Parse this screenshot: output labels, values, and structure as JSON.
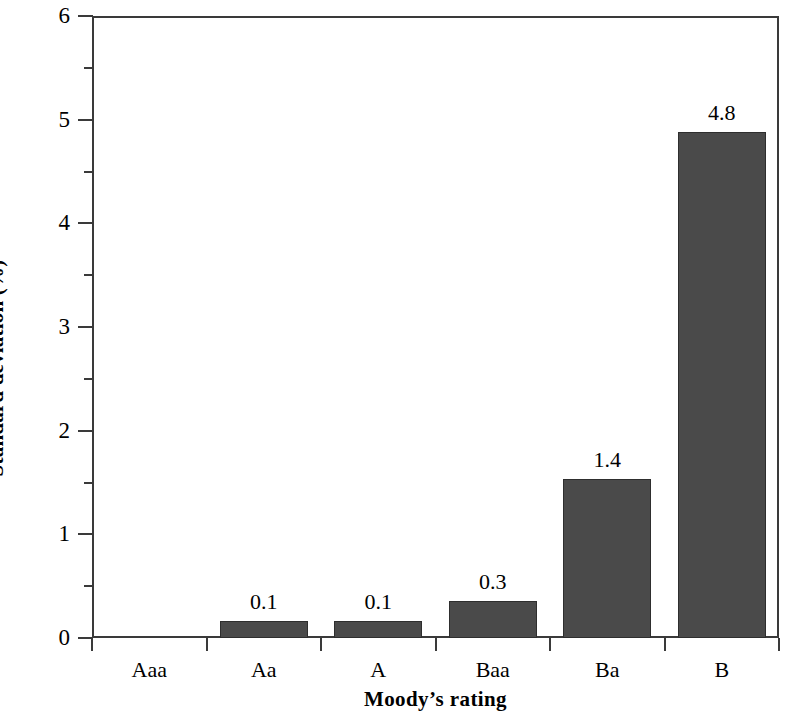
{
  "chart_data": {
    "type": "bar",
    "title": "",
    "xlabel": "Moody’s rating",
    "ylabel": "Standard deviation (%)",
    "categories": [
      "Aaa",
      "Aa",
      "A",
      "Baa",
      "Ba",
      "B"
    ],
    "values": [
      0.0,
      0.1,
      0.1,
      0.3,
      1.4,
      4.8
    ],
    "bar_pixel_values": [
      0.0,
      0.16,
      0.16,
      0.36,
      1.53,
      4.88
    ],
    "data_labels": [
      "",
      "0.1",
      "0.1",
      "0.3",
      "1.4",
      "4.8"
    ],
    "ylim": [
      0,
      6
    ],
    "y_major_ticks": [
      0,
      1,
      2,
      3,
      4,
      5,
      6
    ],
    "y_major_tick_labels": [
      "0",
      "1",
      "2",
      "3",
      "4",
      "5",
      "6"
    ],
    "y_minor_ticks": [
      0.5,
      1.5,
      2.5,
      3.5,
      4.5,
      5.5
    ],
    "grid": false,
    "legend": null,
    "bar_color": "#4a4a4a",
    "axis_color": "#3a3a3a",
    "background_color": "#ffffff"
  }
}
